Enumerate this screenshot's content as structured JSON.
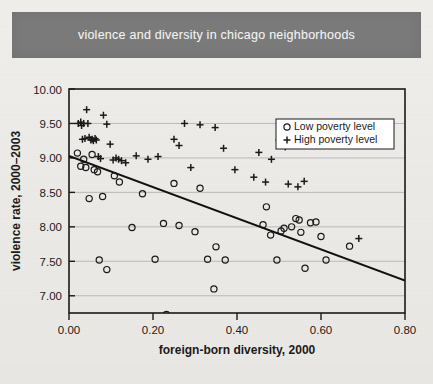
{
  "banner": {
    "title": "violence and diversity in chicago neighborhoods",
    "bg_color": "#797a79",
    "text_color": "#f2f2f0"
  },
  "chart_data": {
    "type": "scatter",
    "title": "violence and diversity in chicago neighborhoods",
    "xlabel": "foreign-born diversity, 2000",
    "ylabel": "violence rate, 2000–2003",
    "xlim": [
      0.0,
      0.8
    ],
    "ylim": [
      6.75,
      10.0
    ],
    "xticks": [
      0.0,
      0.2,
      0.4,
      0.6,
      0.8
    ],
    "xtick_labels": [
      "0.00",
      "0.20",
      "0.40",
      "0.60",
      "0.80"
    ],
    "yticks": [
      7.0,
      7.5,
      8.0,
      8.5,
      9.0,
      9.5,
      10.0
    ],
    "ytick_labels": [
      "7.00",
      "7.50",
      "8.00",
      "8.50",
      "9.00",
      "9.50",
      "10.00"
    ],
    "grid": "horizontal",
    "grid_color": "#b9b9b9",
    "axis_color": "#1a1a1a",
    "marker_color": "#1a1a1a",
    "legend_position": "upper-right",
    "legend_entries": [
      {
        "marker": "circle",
        "label": "Low poverty level"
      },
      {
        "marker": "plus",
        "label": "High poverty level"
      }
    ],
    "series": [
      {
        "name": "Low poverty level",
        "marker": "circle",
        "points": [
          [
            0.02,
            9.07
          ],
          [
            0.028,
            8.88
          ],
          [
            0.035,
            8.98
          ],
          [
            0.04,
            8.86
          ],
          [
            0.048,
            8.41
          ],
          [
            0.055,
            9.05
          ],
          [
            0.06,
            8.83
          ],
          [
            0.068,
            8.8
          ],
          [
            0.072,
            7.52
          ],
          [
            0.08,
            8.44
          ],
          [
            0.09,
            7.38
          ],
          [
            0.108,
            8.74
          ],
          [
            0.12,
            8.65
          ],
          [
            0.15,
            7.99
          ],
          [
            0.175,
            8.48
          ],
          [
            0.205,
            7.53
          ],
          [
            0.225,
            8.05
          ],
          [
            0.232,
            6.73
          ],
          [
            0.25,
            8.63
          ],
          [
            0.262,
            8.02
          ],
          [
            0.3,
            7.93
          ],
          [
            0.312,
            8.56
          ],
          [
            0.33,
            7.53
          ],
          [
            0.345,
            7.1
          ],
          [
            0.35,
            7.71
          ],
          [
            0.372,
            7.52
          ],
          [
            0.462,
            8.03
          ],
          [
            0.47,
            8.29
          ],
          [
            0.48,
            7.88
          ],
          [
            0.495,
            7.52
          ],
          [
            0.505,
            7.94
          ],
          [
            0.512,
            7.98
          ],
          [
            0.53,
            8.0
          ],
          [
            0.54,
            8.12
          ],
          [
            0.548,
            8.1
          ],
          [
            0.552,
            7.92
          ],
          [
            0.562,
            7.4
          ],
          [
            0.575,
            8.06
          ],
          [
            0.588,
            8.07
          ],
          [
            0.6,
            7.86
          ],
          [
            0.612,
            7.52
          ],
          [
            0.668,
            7.72
          ]
        ]
      },
      {
        "name": "High poverty level",
        "marker": "plus",
        "points": [
          [
            0.022,
            9.5
          ],
          [
            0.028,
            9.52
          ],
          [
            0.03,
            9.47
          ],
          [
            0.032,
            9.27
          ],
          [
            0.035,
            9.5
          ],
          [
            0.038,
            9.28
          ],
          [
            0.042,
            9.7
          ],
          [
            0.045,
            9.5
          ],
          [
            0.048,
            9.3
          ],
          [
            0.052,
            9.26
          ],
          [
            0.055,
            9.27
          ],
          [
            0.058,
            9.25
          ],
          [
            0.062,
            9.28
          ],
          [
            0.065,
            9.26
          ],
          [
            0.07,
            9.02
          ],
          [
            0.075,
            8.99
          ],
          [
            0.082,
            9.62
          ],
          [
            0.09,
            9.49
          ],
          [
            0.098,
            9.2
          ],
          [
            0.105,
            8.97
          ],
          [
            0.112,
            9.0
          ],
          [
            0.118,
            8.98
          ],
          [
            0.125,
            8.96
          ],
          [
            0.135,
            8.93
          ],
          [
            0.16,
            9.03
          ],
          [
            0.188,
            8.98
          ],
          [
            0.212,
            9.02
          ],
          [
            0.25,
            9.27
          ],
          [
            0.262,
            9.18
          ],
          [
            0.275,
            9.5
          ],
          [
            0.29,
            8.86
          ],
          [
            0.312,
            9.48
          ],
          [
            0.348,
            9.44
          ],
          [
            0.368,
            9.14
          ],
          [
            0.395,
            8.83
          ],
          [
            0.44,
            8.72
          ],
          [
            0.452,
            9.08
          ],
          [
            0.468,
            8.65
          ],
          [
            0.482,
            8.98
          ],
          [
            0.5,
            9.26
          ],
          [
            0.512,
            9.28
          ],
          [
            0.515,
            9.16
          ],
          [
            0.522,
            8.62
          ],
          [
            0.545,
            8.58
          ],
          [
            0.56,
            8.66
          ],
          [
            0.69,
            7.83
          ]
        ]
      }
    ],
    "regression_line": {
      "from": [
        0.0,
        9.03
      ],
      "to": [
        0.8,
        7.22
      ],
      "color": "#111111",
      "width": 2
    }
  }
}
